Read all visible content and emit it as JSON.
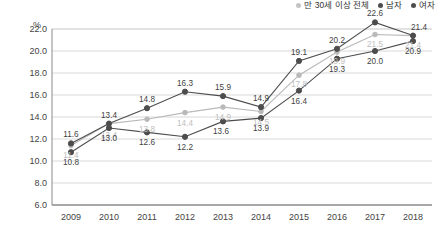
{
  "chart_data": {
    "type": "line",
    "title": "",
    "xlabel": "",
    "ylabel": "%",
    "ylim": [
      6.0,
      22.0
    ],
    "ytick_step": 2.0,
    "grid": true,
    "legend_position": "top-right",
    "categories": [
      "2009",
      "2010",
      "2011",
      "2012",
      "2013",
      "2014",
      "2015",
      "2016",
      "2017",
      "2018"
    ],
    "yticks": [
      "22.0",
      "20.0",
      "18.0",
      "16.0",
      "14.0",
      "12.0",
      "10.0",
      "8.0",
      "6.0"
    ],
    "series": [
      {
        "name": "만 30세 이상 전체",
        "color": "#b9b9b9",
        "values": [
          11.4,
          13.4,
          13.8,
          14.4,
          14.9,
          14.5,
          17.8,
          19.9,
          21.5,
          21.4
        ],
        "labels": [
          "11.4",
          "13.4",
          "13.8",
          "14.4",
          "14.9",
          "14.5",
          "17.8",
          "19.9",
          "21.5",
          "21.4"
        ]
      },
      {
        "name": "남자",
        "color": "#4d4d4d",
        "values": [
          11.6,
          13.4,
          14.8,
          16.3,
          15.9,
          14.9,
          19.1,
          20.2,
          22.6,
          21.4
        ],
        "labels": [
          "11.6",
          "13.4",
          "14.8",
          "16.3",
          "15.9",
          "14.9",
          "19.1",
          "20.2",
          "22.6",
          "21.4"
        ]
      },
      {
        "name": "여자",
        "color": "#4d4d4d",
        "values": [
          10.8,
          13.0,
          12.6,
          12.2,
          13.6,
          13.9,
          16.4,
          19.3,
          20.0,
          20.9
        ],
        "labels": [
          "10.8",
          "13.0",
          "12.6",
          "12.2",
          "13.6",
          "13.9",
          "16.4",
          "19.3",
          "20.0",
          "20.9"
        ]
      }
    ],
    "colors": {
      "grid": "#d9d9d9",
      "axis": "#8a8a8a",
      "text": "#444444",
      "series_total": "#b9b9b9",
      "series_male": "#4d4d4d",
      "series_female": "#4d4d4d"
    }
  }
}
